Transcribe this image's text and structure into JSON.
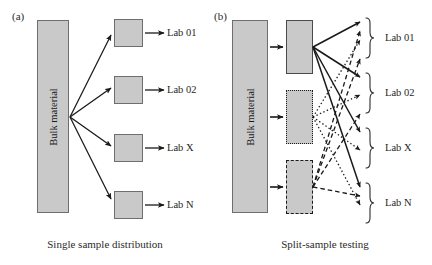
{
  "figure": {
    "panels": [
      {
        "id": "a",
        "label": "(a)",
        "caption": "Single sample distribution",
        "bulk_label": "Bulk material",
        "lab_labels": [
          "Lab 01",
          "Lab 02",
          "Lab X",
          "Lab N"
        ],
        "arrow_style": "solid",
        "description": "One bulk material bar fans out with four solid arrows to four sample boxes, each feeding one lab."
      },
      {
        "id": "b",
        "label": "(b)",
        "caption": "Split-sample testing",
        "bulk_label": "Bulk material",
        "lab_labels": [
          "Lab 01",
          "Lab 02",
          "Lab X",
          "Lab N"
        ],
        "split_samples": [
          {
            "name": "split-sample-1",
            "border": "solid",
            "arrow_style": "solid"
          },
          {
            "name": "split-sample-2",
            "border": "dotted",
            "arrow_style": "dotted"
          },
          {
            "name": "split-sample-3",
            "border": "dashed",
            "arrow_style": "dashed"
          }
        ],
        "description": "Bulk material is divided into three split samples; each split sample sends one arrow to every lab, grouped by braces."
      }
    ],
    "colors": {
      "fill_gray": "#c9c9c9",
      "stroke_dark": "#1a1a1a",
      "stroke_box": "#6e6e6e",
      "background": "#ffffff",
      "text": "#1a1a1a"
    }
  }
}
